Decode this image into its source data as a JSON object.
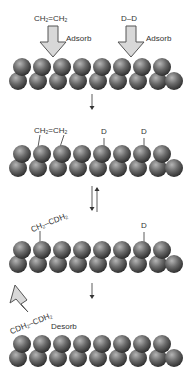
{
  "diagram": {
    "type": "surface-reaction-mechanism",
    "steps": [
      {
        "id": "step1-adsorb",
        "labels": [
          {
            "text_main": "CH",
            "sub1": "2",
            "mid": "=CH",
            "sub2": "2"
          },
          {
            "text": "Adsorb"
          },
          {
            "text": "D–D"
          },
          {
            "text": "Adsorb"
          }
        ]
      },
      {
        "id": "step2-adsorbed",
        "labels": [
          {
            "text_main": "CH",
            "sub1": "2",
            "mid": "=CH",
            "sub2": "2"
          },
          {
            "text": "D"
          },
          {
            "text": "D"
          }
        ]
      },
      {
        "id": "step3-intermediate",
        "labels": [
          {
            "text_main": "CH",
            "sub1": "2",
            "mid": "–CDH",
            "sub2": "2"
          },
          {
            "text": "D"
          }
        ]
      },
      {
        "id": "step4-desorb",
        "labels": [
          {
            "text_main": "CDH",
            "sub1": "2",
            "mid": "–CDH",
            "sub2": "2"
          },
          {
            "text": "Desorb"
          }
        ]
      }
    ],
    "arrows": [
      "forward",
      "equilibrium",
      "forward"
    ],
    "colors": {
      "sphere_dark": "#3a3a3a",
      "sphere_light": "#9a9a9a",
      "block_arrow_fill": "#d8d8d8",
      "block_arrow_stroke": "#555555"
    }
  }
}
